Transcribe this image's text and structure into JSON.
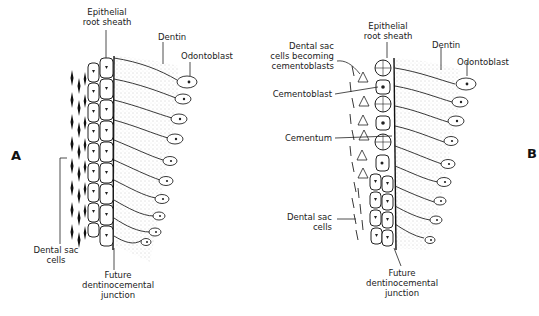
{
  "figure": {
    "panels": [
      {
        "id": "A",
        "letter": "A",
        "labels": {
          "epithelial_root_sheath_1": "Epithelial",
          "epithelial_root_sheath_2": "root sheath",
          "dentin": "Dentin",
          "odontoblast": "Odontoblast",
          "dental_sac_cells_1": "Dental sac",
          "dental_sac_cells_2": "cells",
          "future_junction_1": "Future",
          "future_junction_2": "dentinocemental",
          "future_junction_3": "junction"
        }
      },
      {
        "id": "B",
        "letter": "B",
        "labels": {
          "epithelial_root_sheath_1": "Epithelial",
          "epithelial_root_sheath_2": "root sheath",
          "dentin": "Dentin",
          "odontoblast": "Odontoblast",
          "dental_sac_becoming_1": "Dental sac",
          "dental_sac_becoming_2": "cells becoming",
          "dental_sac_becoming_3": "cementoblasts",
          "cementoblast": "Cementoblast",
          "cementum": "Cementum",
          "dental_sac_cells_1": "Dental sac",
          "dental_sac_cells_2": "cells",
          "future_junction_1": "Future",
          "future_junction_2": "dentinocemental",
          "future_junction_3": "junction"
        }
      }
    ]
  }
}
